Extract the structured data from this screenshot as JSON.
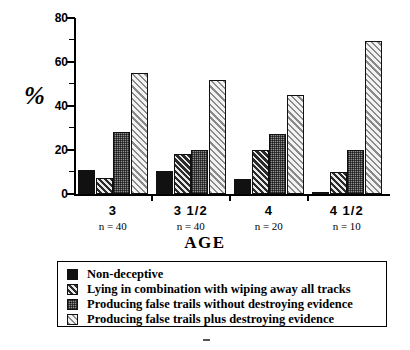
{
  "chart_data": {
    "type": "bar",
    "title": "",
    "xlabel": "AGE",
    "ylabel": "%",
    "ylim": [
      0,
      80
    ],
    "yticks": [
      0,
      20,
      40,
      60,
      80
    ],
    "yminor_step": 10,
    "grid": false,
    "legend_position": "below-plot",
    "categories": [
      "3",
      "3  1/2",
      "4",
      "4  1/2"
    ],
    "category_sublabels": [
      "n = 40",
      "n = 40",
      "n = 20",
      "n = 10"
    ],
    "series": [
      {
        "name": "Non-deceptive",
        "pattern": "solid-black",
        "values": [
          11,
          10.5,
          7,
          1
        ]
      },
      {
        "name": "Lying in combination with wiping away all tracks",
        "pattern": "dark-diagonal-hatch",
        "values": [
          7.5,
          18,
          20,
          10
        ]
      },
      {
        "name": "Producing false trails without destroying evidence",
        "pattern": "gray-checker",
        "values": [
          28,
          20,
          27.5,
          20
        ]
      },
      {
        "name": "Producing false trails plus destroying evidence",
        "pattern": "light-diagonal-hatch",
        "values": [
          55,
          52,
          45,
          69.5
        ]
      }
    ]
  },
  "axes": {
    "y_tick_labels": [
      "80",
      "60",
      "40",
      "20",
      "0"
    ],
    "y_axis_title": "%",
    "x_axis_title": "AGE"
  },
  "legend": {
    "items": [
      {
        "label": "Non-deceptive",
        "swatch": "solid-black-swatch"
      },
      {
        "label": "Lying in combination with wiping away all tracks",
        "swatch": "dark-diagonal-hatch-swatch"
      },
      {
        "label": "Producing false trails without destroying evidence",
        "swatch": "gray-checker-swatch"
      },
      {
        "label": "Producing false trails plus destroying evidence",
        "swatch": "light-diagonal-hatch-swatch"
      }
    ]
  },
  "colors": {
    "axis": "#000000",
    "solid_black": "#111111",
    "dark_hatch": "#2b2b2b",
    "gray_check": "#8f8f8f",
    "light_hatch": "#f2f2f2",
    "background": "#ffffff"
  }
}
